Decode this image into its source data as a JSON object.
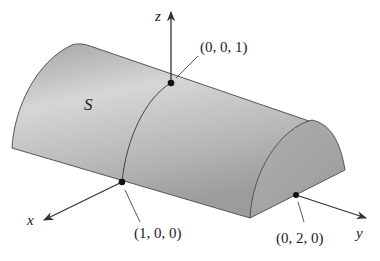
{
  "figure": {
    "surface_label": "S",
    "axes": {
      "x": "x",
      "y": "y",
      "z": "z"
    },
    "points": [
      {
        "id": "p001",
        "label": "(0, 0, 1)"
      },
      {
        "id": "p100",
        "label": "(1, 0, 0)"
      },
      {
        "id": "p020",
        "label": "(0, 2, 0)"
      }
    ],
    "colors": {
      "surface_light": "#d9d9d9",
      "surface_dark": "#9a9a9a",
      "endcap": "#a8a8a8",
      "outline": "#555555",
      "axis": "#333333"
    }
  }
}
